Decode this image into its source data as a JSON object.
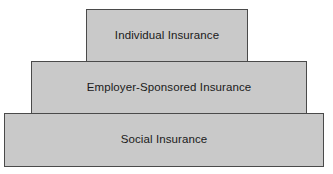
{
  "diagram": {
    "type": "stacked-tier-pyramid",
    "orientation": "vertical",
    "tier_count": 3,
    "colors": {
      "tier_fill": "#c9c9c9",
      "tier_border": "#4a4a4a",
      "label_text": "#1a1a1a",
      "background": "#ffffff"
    },
    "tiers": [
      {
        "level": 1,
        "position": "top",
        "label": "Individual Insurance",
        "relative_width": "narrow"
      },
      {
        "level": 2,
        "position": "middle",
        "label": "Employer-Sponsored Insurance",
        "relative_width": "medium"
      },
      {
        "level": 3,
        "position": "bottom",
        "label": "Social Insurance",
        "relative_width": "wide"
      }
    ]
  }
}
